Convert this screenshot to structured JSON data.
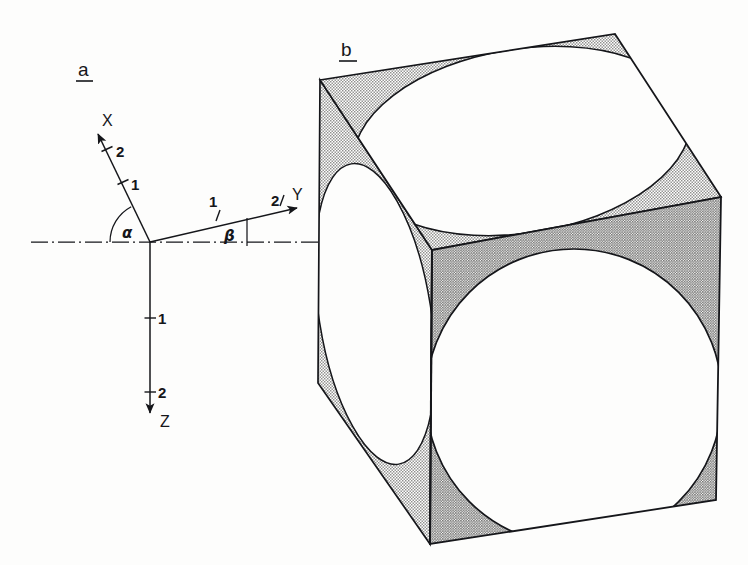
{
  "figure": {
    "background_color": "#fdfdfc",
    "ink_color": "#15161a",
    "panels": [
      {
        "id": "a",
        "label": "a",
        "underlined": true
      },
      {
        "id": "b",
        "label": "b",
        "underlined": true
      }
    ]
  },
  "panel_a": {
    "label": "a",
    "description": "Right-handed coordinate axis triad X, Y, Z drawn in oblique projection with a horizontal dash-dot reference line",
    "reference_line_style": "dash-dot",
    "origin_label": "",
    "axes": [
      {
        "name": "X",
        "label": "X",
        "direction": "up-left",
        "angle_deg_from_horizontal": 118,
        "tick_labels": [
          "1",
          "2"
        ],
        "arrowhead": true
      },
      {
        "name": "Y",
        "label": "Y",
        "direction": "up-right",
        "angle_deg_from_horizontal": 13,
        "tick_labels": [
          "1",
          "2"
        ],
        "arrowhead": true
      },
      {
        "name": "Z",
        "label": "Z",
        "direction": "down",
        "angle_deg_from_horizontal": 270,
        "tick_labels": [
          "1",
          "2"
        ],
        "arrowhead": true
      }
    ],
    "angles": [
      {
        "name": "alpha",
        "label": "α",
        "between": [
          "reference-line",
          "X-axis"
        ],
        "arc": true
      },
      {
        "name": "beta",
        "label": "β",
        "between": [
          "reference-line",
          "Y-axis"
        ],
        "arc": false
      }
    ]
  },
  "panel_b": {
    "label": "b",
    "description": "Cube in oblique projection with an inscribed sphere; each visible face shows the circle of tangency as a circle or ellipse, and the remaining corner areas are stippled",
    "faces": [
      {
        "name": "top-face",
        "inscribed_shape": "ellipse",
        "shading": "light-stipple"
      },
      {
        "name": "front-right-face",
        "inscribed_shape": "circle",
        "shading": "dark-stipple"
      },
      {
        "name": "left-face",
        "inscribed_shape": "narrow-ellipse",
        "shading": "light-stipple"
      }
    ],
    "shading": {
      "light_stipple_color": "#d2d2d0",
      "dark_stipple_color": "#c3c3c1",
      "inscribed_fill": "#fdfdfc"
    }
  }
}
